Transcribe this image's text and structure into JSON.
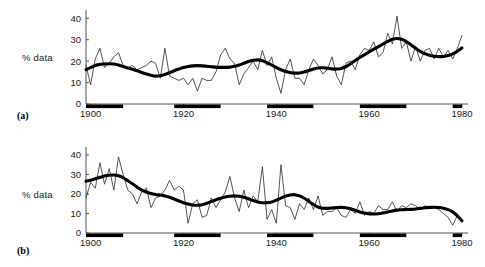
{
  "figure": {
    "panel_a_tag": "(a)",
    "panel_b_tag": "(b)",
    "ylabel": "% data"
  },
  "chart_data": [
    {
      "type": "line",
      "panel": "(a)",
      "title": "",
      "xlabel": "",
      "ylabel": "% data",
      "xlim": [
        1899,
        1980
      ],
      "ylim": [
        0,
        42
      ],
      "xticks": [
        1900,
        1920,
        1940,
        1960,
        1980
      ],
      "yticks": [
        0,
        10,
        20,
        30,
        40
      ],
      "grid": false,
      "legend": "none",
      "x": [
        1899,
        1900,
        1901,
        1902,
        1903,
        1904,
        1905,
        1906,
        1907,
        1908,
        1909,
        1910,
        1911,
        1912,
        1913,
        1914,
        1915,
        1916,
        1917,
        1918,
        1919,
        1920,
        1921,
        1922,
        1923,
        1924,
        1925,
        1926,
        1927,
        1928,
        1929,
        1930,
        1931,
        1932,
        1933,
        1934,
        1935,
        1936,
        1937,
        1938,
        1939,
        1940,
        1941,
        1942,
        1943,
        1944,
        1945,
        1946,
        1947,
        1948,
        1949,
        1950,
        1951,
        1952,
        1953,
        1954,
        1955,
        1956,
        1957,
        1958,
        1959,
        1960,
        1961,
        1962,
        1963,
        1964,
        1965,
        1966,
        1967,
        1968,
        1969,
        1970,
        1971,
        1972,
        1973,
        1974,
        1975,
        1976,
        1977,
        1978,
        1979,
        1980
      ],
      "series": [
        {
          "name": "annual values",
          "style": "thin",
          "values": [
            18,
            9,
            21,
            26,
            17,
            19,
            22,
            24,
            18,
            17,
            18,
            16,
            17,
            18,
            20,
            19,
            12,
            26,
            13,
            12,
            11,
            12,
            9,
            12,
            6,
            12,
            11,
            11,
            15,
            23,
            26,
            21,
            19,
            9,
            14,
            17,
            20,
            16,
            25,
            18,
            22,
            12,
            5,
            16,
            21,
            12,
            12,
            9,
            16,
            21,
            18,
            14,
            16,
            22,
            13,
            9,
            19,
            20,
            16,
            23,
            26,
            25,
            29,
            22,
            24,
            33,
            28,
            41,
            26,
            29,
            20,
            27,
            20,
            25,
            26,
            21,
            26,
            22,
            25,
            21,
            26,
            32
          ]
        },
        {
          "name": "smoothed trend",
          "style": "thick",
          "values": [
            16,
            17,
            18,
            18.5,
            18.7,
            18.8,
            18.7,
            18.2,
            17.5,
            16.8,
            16.2,
            15.5,
            14.7,
            14,
            13.4,
            13,
            13.2,
            13.8,
            14.6,
            15.5,
            16.3,
            17,
            17.5,
            17.8,
            17.9,
            17.8,
            17.6,
            17.4,
            17.2,
            17.1,
            17.1,
            17.2,
            17.6,
            18.2,
            19,
            19.8,
            20.4,
            20.6,
            20.2,
            19.3,
            18.2,
            17,
            16,
            15.2,
            14.7,
            14.4,
            14.5,
            14.9,
            15.6,
            16.3,
            16.8,
            16.9,
            16.7,
            16.4,
            16.3,
            16.6,
            17.5,
            18.8,
            20.3,
            21.7,
            23,
            24.3,
            25.6,
            26.8,
            28,
            29.2,
            30.2,
            30.6,
            30.2,
            29.1,
            27.6,
            26,
            24.6,
            23.5,
            22.7,
            22.3,
            22.1,
            22.2,
            22.6,
            23.4,
            24.6,
            26.2,
            28.2,
            30.4
          ]
        }
      ],
      "period_bars": [
        {
          "start": 1899,
          "end": 1907
        },
        {
          "start": 1918,
          "end": 1928
        },
        {
          "start": 1938,
          "end": 1948
        },
        {
          "start": 1958,
          "end": 1968
        },
        {
          "start": 1978,
          "end": 1980
        }
      ]
    },
    {
      "type": "line",
      "panel": "(b)",
      "title": "",
      "xlabel": "",
      "ylabel": "% data",
      "xlim": [
        1899,
        1980
      ],
      "ylim": [
        0,
        42
      ],
      "xticks": [
        1900,
        1920,
        1940,
        1960,
        1980
      ],
      "yticks": [
        0,
        10,
        20,
        30,
        40
      ],
      "grid": false,
      "legend": "none",
      "x": [
        1899,
        1900,
        1901,
        1902,
        1903,
        1904,
        1905,
        1906,
        1907,
        1908,
        1909,
        1910,
        1911,
        1912,
        1913,
        1914,
        1915,
        1916,
        1917,
        1918,
        1919,
        1920,
        1921,
        1922,
        1923,
        1924,
        1925,
        1926,
        1927,
        1928,
        1929,
        1930,
        1931,
        1932,
        1933,
        1934,
        1935,
        1936,
        1937,
        1938,
        1939,
        1940,
        1941,
        1942,
        1943,
        1944,
        1945,
        1946,
        1947,
        1948,
        1949,
        1950,
        1951,
        1952,
        1953,
        1954,
        1955,
        1956,
        1957,
        1958,
        1959,
        1960,
        1961,
        1962,
        1963,
        1964,
        1965,
        1966,
        1967,
        1968,
        1969,
        1970,
        1971,
        1972,
        1973,
        1974,
        1975,
        1976,
        1977,
        1978,
        1979,
        1980
      ],
      "series": [
        {
          "name": "annual values",
          "style": "thin",
          "values": [
            18,
            26,
            23,
            36,
            25,
            33,
            22,
            39,
            30,
            22,
            20,
            15,
            21,
            23,
            13,
            18,
            19,
            22,
            27,
            22,
            24,
            22,
            5,
            15,
            17,
            8,
            9,
            18,
            13,
            17,
            21,
            29,
            18,
            11,
            22,
            13,
            19,
            16,
            34,
            7,
            12,
            5,
            35,
            14,
            13,
            7,
            15,
            12,
            18,
            12,
            19,
            9,
            11,
            11,
            13,
            9,
            8,
            12,
            10,
            16,
            9,
            11,
            10,
            14,
            12,
            12,
            16,
            11,
            14,
            13,
            15,
            14,
            12,
            14,
            13,
            13,
            12,
            10,
            8,
            4,
            9,
            6
          ]
        },
        {
          "name": "smoothed trend",
          "style": "thick",
          "values": [
            26.5,
            27,
            27.8,
            28.5,
            29.2,
            29.6,
            29.7,
            29.3,
            28.3,
            26.8,
            25.2,
            23.5,
            22,
            21,
            20.2,
            19.7,
            19.4,
            19,
            18.3,
            17.4,
            16.4,
            15.5,
            14.8,
            14.3,
            14.2,
            14.5,
            15.2,
            16.1,
            17,
            17.8,
            18.4,
            18.8,
            19,
            18.8,
            18.3,
            17.5,
            16.6,
            15.9,
            15.5,
            15.5,
            15.9,
            16.8,
            17.9,
            18.9,
            19.5,
            19.6,
            19,
            17.8,
            16.2,
            14.6,
            13.3,
            12.7,
            12.6,
            12.8,
            13,
            13.1,
            12.9,
            12.4,
            11.6,
            10.8,
            10.2,
            9.8,
            9.7,
            9.9,
            10.3,
            10.8,
            11.3,
            11.7,
            11.9,
            12,
            12.1,
            12.3,
            12.6,
            12.9,
            13.1,
            13.2,
            13.1,
            12.7,
            12,
            10.8,
            8.8,
            6.2
          ]
        }
      ],
      "period_bars": [
        {
          "start": 1899,
          "end": 1907
        },
        {
          "start": 1918,
          "end": 1928
        },
        {
          "start": 1938,
          "end": 1948
        },
        {
          "start": 1958,
          "end": 1968
        },
        {
          "start": 1978,
          "end": 1980
        }
      ]
    }
  ]
}
